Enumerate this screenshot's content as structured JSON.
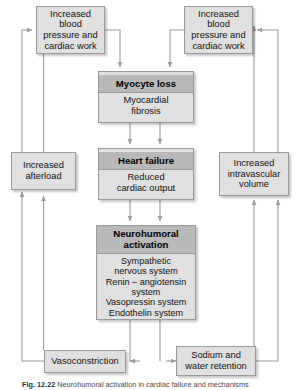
{
  "figure": {
    "caption_label": "Fig. 12.22",
    "caption_text": "Neurohumoral activation in cardiac failure and mechanisms",
    "accent_header": "#b9b9b9",
    "accent_body": "#e0e0e0",
    "line_color": "#9a9a9a"
  },
  "nodes": {
    "bp_left": {
      "text": "Increased\nblood\npressure and\ncardiac work"
    },
    "bp_right": {
      "text": "Increased\nblood\npressure and\ncardiac work"
    },
    "myocyte": {
      "header": "Myocyte loss",
      "body": "Myocardial\nfibrosis"
    },
    "heart_failure": {
      "header": "Heart failure",
      "body": "Reduced\ncardiac output"
    },
    "neurohumoral": {
      "header": "Neurohumoral\nactivation",
      "body": "Sympathetic\nnervous system\nRenin – angiotensin\nsystem\nVasopressin system\nEndothelin system"
    },
    "afterload": {
      "text": "Increased\nafterload"
    },
    "volume": {
      "text": "Increased\nintravascular\nvolume"
    },
    "vasoconstriction": {
      "text": "Vasoconstriction"
    },
    "sodium": {
      "text": "Sodium and\nwater retention"
    }
  }
}
